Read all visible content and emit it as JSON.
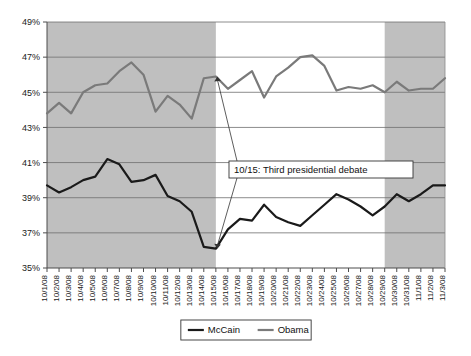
{
  "chart_data": {
    "type": "line",
    "title": "",
    "subtitle": "",
    "xlabel": "",
    "ylabel": "",
    "ylim": [
      35,
      49
    ],
    "ytick_step": 2,
    "ytick_labels": [
      "49%",
      "47%",
      "45%",
      "43%",
      "41%",
      "39%",
      "37%",
      "35%"
    ],
    "ytick_values": [
      49,
      47,
      45,
      43,
      41,
      39,
      37,
      35
    ],
    "grid": true,
    "legend_position": "bottom",
    "categories": [
      "10/1/08",
      "10/2/08",
      "10/3/08",
      "10/4/08",
      "10/5/08",
      "10/6/08",
      "10/7/08",
      "10/8/08",
      "10/9/08",
      "10/10/08",
      "10/11/08",
      "10/12/08",
      "10/13/08",
      "10/14/08",
      "10/15/08",
      "10/16/08",
      "10/17/08",
      "10/18/08",
      "10/19/08",
      "10/20/08",
      "10/21/08",
      "10/22/08",
      "10/23/08",
      "10/24/08",
      "10/25/08",
      "10/26/08",
      "10/27/08",
      "10/28/08",
      "10/29/08",
      "10/30/08",
      "10/31/08",
      "11/1/08",
      "11/2/08",
      "11/3/08"
    ],
    "series": [
      {
        "name": "McCain",
        "color": "#1a1a1a",
        "line_width": 2.2,
        "values": [
          39.7,
          39.3,
          39.6,
          40.0,
          40.2,
          41.2,
          40.9,
          39.9,
          40.0,
          40.3,
          39.1,
          38.8,
          38.2,
          36.2,
          36.1,
          37.2,
          37.8,
          37.7,
          38.6,
          37.9,
          37.6,
          37.4,
          38.0,
          38.6,
          39.2,
          38.9,
          38.5,
          38.0,
          38.5,
          39.2,
          38.8,
          39.2,
          39.7,
          39.7
        ]
      },
      {
        "name": "Obama",
        "color": "#7a7a7a",
        "line_width": 2.2,
        "values": [
          43.8,
          44.4,
          43.8,
          45.0,
          45.4,
          45.5,
          46.2,
          46.7,
          46.0,
          43.9,
          44.8,
          44.3,
          43.5,
          45.8,
          45.9,
          45.2,
          45.7,
          46.2,
          44.7,
          45.9,
          46.4,
          47.0,
          47.1,
          46.5,
          45.1,
          45.3,
          45.2,
          45.4,
          45.0,
          45.6,
          45.1,
          45.2,
          45.2,
          45.8
        ]
      }
    ],
    "shaded_bands": [
      {
        "name": "pre-debate-shading",
        "from_index": 0,
        "to_index": 14,
        "color": "#bfbfbf"
      },
      {
        "name": "post-debate-shading",
        "from_index": 28,
        "to_index": 33,
        "color": "#bfbfbf"
      }
    ],
    "annotations": [
      {
        "name": "third-debate-callout",
        "text": "10/15: Third presidential debate",
        "points_to_index": 14,
        "targets": [
          "Obama",
          "McCain"
        ]
      }
    ]
  },
  "legend": {
    "items": [
      {
        "label": "McCain",
        "color": "#1a1a1a"
      },
      {
        "label": "Obama",
        "color": "#7a7a7a"
      }
    ]
  }
}
